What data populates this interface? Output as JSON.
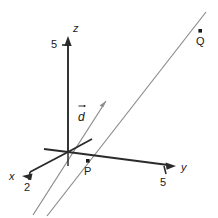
{
  "figure": {
    "kind": "3d-coordinate-axes-diagram",
    "background_color": "#ffffff",
    "axis_color": "#1a1a1a",
    "line_color": "#8c8c8c",
    "text_color": "#1a1a1a"
  },
  "axes": [
    {
      "name": "z-axis",
      "label": "z",
      "tick_label": "5",
      "direction": "up",
      "origin": [
        68,
        152
      ],
      "tip": [
        68,
        38
      ]
    },
    {
      "name": "y-axis",
      "label": "y",
      "tick_label": "5",
      "direction": "right",
      "origin": [
        68,
        152
      ],
      "tip": [
        175,
        166
      ]
    },
    {
      "name": "x-axis",
      "label": "x",
      "tick_label": "2",
      "direction": "lower-left",
      "origin": [
        68,
        152
      ],
      "tip": [
        24,
        174
      ]
    }
  ],
  "vector": {
    "name": "direction-vector",
    "label": "d",
    "has_overarrow": true,
    "tail": [
      57,
      145
    ],
    "tip": [
      106,
      101
    ]
  },
  "points": [
    {
      "name": "point-P",
      "label": "P",
      "dot": [
        88,
        161
      ],
      "label_pos": [
        85,
        172
      ]
    },
    {
      "name": "point-Q",
      "label": "Q",
      "dot": [
        200,
        31
      ],
      "label_pos": [
        196,
        44
      ]
    }
  ],
  "lines": [
    {
      "name": "parametric-line",
      "start": [
        47,
        216
      ],
      "end": [
        206,
        12
      ],
      "color": "#8c8c8c",
      "passes_through": "P"
    }
  ],
  "tick_labels": {
    "z_five": "5",
    "y_five": "5",
    "x_two": "2"
  }
}
